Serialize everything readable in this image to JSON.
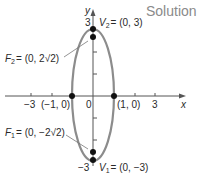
{
  "header": {
    "title": "Solution"
  },
  "colors": {
    "ellipse": "#8c8c8c",
    "axis": "#555555",
    "point": "#111111",
    "title": "#8a8a8a"
  },
  "axes": {
    "x_label": "x",
    "y_label": "y",
    "x_ticks": [
      {
        "value": -3,
        "label": "−3"
      },
      {
        "value": -2,
        "label": ""
      },
      {
        "value": 2,
        "label": ""
      },
      {
        "value": 3,
        "label": "3"
      }
    ],
    "y_ticks": [
      {
        "value": 3,
        "label": "3"
      },
      {
        "value": 2,
        "label": ""
      },
      {
        "value": 1,
        "label": ""
      },
      {
        "value": -1,
        "label": ""
      },
      {
        "value": -2,
        "label": ""
      },
      {
        "value": -3,
        "label": "−3"
      }
    ],
    "origin_label": "0"
  },
  "ellipse": {
    "equation_center": [
      0,
      0
    ],
    "a_vertical": 3,
    "b_horizontal": 1
  },
  "points": {
    "V2": {
      "name": "V",
      "sub": "2",
      "coords": "= (0, 3)",
      "x": 0,
      "y": 3
    },
    "F2": {
      "name": "F",
      "sub": "2",
      "coords": "= (0, 2√2)",
      "x": 0,
      "y": 2.828
    },
    "F1": {
      "name": "F",
      "sub": "1",
      "coords": "= (0, −2√2)",
      "x": 0,
      "y": -2.828
    },
    "V1": {
      "name": "V",
      "sub": "1",
      "coords": "= (0, −3)",
      "x": 0,
      "y": -3
    },
    "left_intercept": {
      "label": "(−1, 0)",
      "x": -1,
      "y": 0
    },
    "right_intercept": {
      "label": "(1, 0)",
      "x": 1,
      "y": 0
    }
  }
}
